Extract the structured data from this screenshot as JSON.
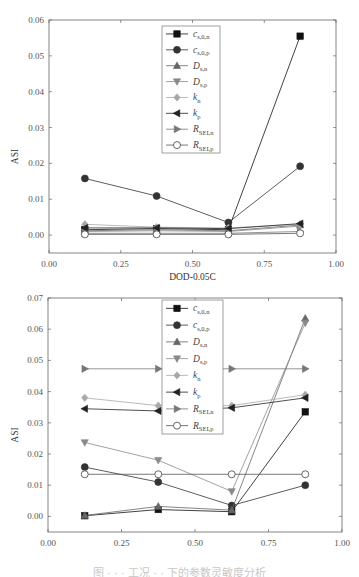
{
  "colors": {
    "c_s0n": "#111111",
    "c_s0p": "#333333",
    "D_sn": "#666666",
    "D_sp": "#8a8a8a",
    "k_n": "#a8a8a8",
    "k_p": "#222222",
    "R_SEIn": "#777777",
    "R_SEIp": "#555555",
    "axis": "#666666"
  },
  "legend_labels": [
    {
      "key": "c_s0n",
      "main": "c",
      "sub": "s,0,n",
      "marker": "square"
    },
    {
      "key": "c_s0p",
      "main": "c",
      "sub": "s,0,p",
      "marker": "circle"
    },
    {
      "key": "D_sn",
      "main": "D",
      "sub": "s,n",
      "marker": "triangle-up"
    },
    {
      "key": "D_sp",
      "main": "D",
      "sub": "s,p",
      "marker": "triangle-down"
    },
    {
      "key": "k_n",
      "main": "k",
      "sub": "n",
      "marker": "diamond"
    },
    {
      "key": "k_p",
      "main": "k",
      "sub": "p",
      "marker": "triangle-left"
    },
    {
      "key": "R_SEIn",
      "main": "R",
      "sub": "SEI,n",
      "marker": "triangle-right"
    },
    {
      "key": "R_SEIp",
      "main": "R",
      "sub": "SEI,p",
      "marker": "open-circle"
    }
  ],
  "chart_data": [
    {
      "type": "line",
      "title": "",
      "xlabel": "DOD-0.05C",
      "ylabel": "ASI",
      "x": [
        0.125,
        0.375,
        0.625,
        0.875
      ],
      "xlim": [
        0.0,
        1.0
      ],
      "ylim": [
        -0.005,
        0.06
      ],
      "xticks": [
        "0.00",
        "0.25",
        "0.50",
        "0.75",
        "1.00"
      ],
      "yticks": [
        "0.00",
        "0.01",
        "0.02",
        "0.03",
        "0.04",
        "0.05",
        "0.06"
      ],
      "grid": false,
      "legend_position": "upper center",
      "series": [
        {
          "name": "c_s,0,n",
          "key": "c_s0n",
          "values": [
            0.0015,
            0.0018,
            0.0015,
            0.0555
          ]
        },
        {
          "name": "c_s,0,p",
          "key": "c_s0p",
          "values": [
            0.0158,
            0.0109,
            0.0035,
            0.0192
          ]
        },
        {
          "name": "D_s,n",
          "key": "D_sn",
          "values": [
            0.0012,
            0.0015,
            0.0012,
            0.0028
          ]
        },
        {
          "name": "D_s,p",
          "key": "D_sp",
          "values": [
            0.001,
            0.0012,
            0.001,
            0.0025
          ]
        },
        {
          "name": "k_n",
          "key": "k_n",
          "values": [
            0.003,
            0.0022,
            0.002,
            0.003
          ]
        },
        {
          "name": "k_p",
          "key": "k_p",
          "values": [
            0.002,
            0.002,
            0.0018,
            0.0032
          ]
        },
        {
          "name": "R_SEI,n",
          "key": "R_SEIn",
          "values": [
            0.0005,
            0.0005,
            0.0005,
            0.001
          ]
        },
        {
          "name": "R_SEI,p",
          "key": "R_SEIp",
          "values": [
            0.0002,
            0.0002,
            0.0002,
            0.0005
          ]
        }
      ]
    },
    {
      "type": "line",
      "title": "",
      "xlabel": "DOD-2C",
      "ylabel": "ASI",
      "x": [
        0.125,
        0.375,
        0.625,
        0.875
      ],
      "xlim": [
        0.0,
        1.0
      ],
      "ylim": [
        -0.005,
        0.07
      ],
      "xticks": [
        "0.00",
        "0.25",
        "0.50",
        "0.75",
        "1.00"
      ],
      "yticks": [
        "0.00",
        "0.01",
        "0.02",
        "0.03",
        "0.04",
        "0.05",
        "0.06",
        "0.07"
      ],
      "grid": false,
      "legend_position": "upper center",
      "series": [
        {
          "name": "c_s,0,n",
          "key": "c_s0n",
          "values": [
            0.0002,
            0.0022,
            0.0015,
            0.0335
          ]
        },
        {
          "name": "c_s,0,p",
          "key": "c_s0p",
          "values": [
            0.0158,
            0.011,
            0.0035,
            0.01
          ]
        },
        {
          "name": "D_s,n",
          "key": "D_sn",
          "values": [
            0.0003,
            0.0032,
            0.002,
            0.0635
          ]
        },
        {
          "name": "D_s,p",
          "key": "D_sp",
          "values": [
            0.0237,
            0.018,
            0.008,
            0.062
          ]
        },
        {
          "name": "k_n",
          "key": "k_n",
          "values": [
            0.038,
            0.0355,
            0.0355,
            0.039
          ]
        },
        {
          "name": "k_p",
          "key": "k_p",
          "values": [
            0.0345,
            0.0338,
            0.0348,
            0.038
          ]
        },
        {
          "name": "R_SEI,n",
          "key": "R_SEIn",
          "values": [
            0.0473,
            0.0473,
            0.0473,
            0.0473
          ]
        },
        {
          "name": "R_SEI,p",
          "key": "R_SEIp",
          "values": [
            0.0135,
            0.0135,
            0.0135,
            0.0135
          ]
        }
      ]
    }
  ],
  "caption": "图 · · · 工况 · · 下的参数灵敏度分析"
}
